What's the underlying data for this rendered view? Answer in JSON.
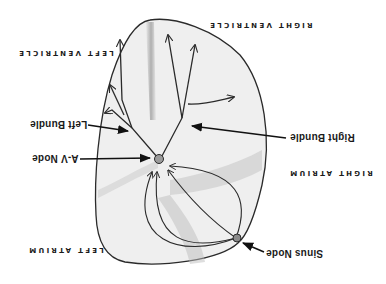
{
  "diagram": {
    "orientation": "upside-down",
    "colors": {
      "outline": "#2a2a2a",
      "fill": "#ececec",
      "shading": "#bdbdbd",
      "label": "#1a1a1a",
      "background": "#ffffff"
    },
    "regions": {
      "right_ventricle": "RIGHT VENTRICLE",
      "left_ventricle": "LEFT VENTRICLE",
      "right_atrium": "RIGHT ATRIUM",
      "left_atrium": "LEFT ATRIUM"
    },
    "structures": {
      "left_bundle": "Left Bundle",
      "right_bundle": "Right Bundle",
      "av_node": "A-V Node",
      "sinus_node": "Sinus Node"
    }
  }
}
